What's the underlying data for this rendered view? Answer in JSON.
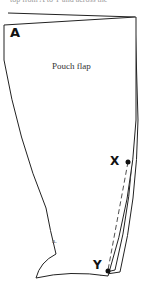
{
  "caption": "top from A to Y and across the",
  "diagram": {
    "title": "Pouch flap",
    "sublabel": "a.",
    "points": [
      {
        "name": "A",
        "x": 12,
        "y": 29
      },
      {
        "name": "X",
        "x": 113,
        "y": 155
      },
      {
        "name": "Y",
        "x": 93,
        "y": 258
      }
    ],
    "colors": {
      "stroke": "#222222",
      "background": "#ffffff"
    }
  }
}
